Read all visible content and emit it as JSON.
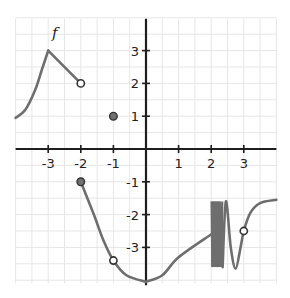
{
  "chart_data": {
    "type": "line",
    "title": "",
    "function_label": "f",
    "xlabel": "",
    "ylabel": "",
    "xlim": [
      -4,
      4
    ],
    "ylim": [
      -4,
      4
    ],
    "grid": true,
    "minor_grid_step": 0.5,
    "x_ticks": [
      -3,
      -2,
      -1,
      1,
      2,
      3
    ],
    "x_tick_labels": [
      "-3",
      "-2",
      "-1",
      "1",
      "2",
      "3"
    ],
    "y_ticks": [
      3,
      2,
      1,
      -1,
      -2,
      -3
    ],
    "y_tick_labels": [
      "3",
      "2",
      "1",
      "-1",
      "-2",
      "-3"
    ],
    "pieces": [
      {
        "name": "left-rising-curve",
        "points": [
          [
            -4,
            0.95
          ],
          [
            -3.7,
            1.2
          ],
          [
            -3.4,
            1.8
          ],
          [
            -3.2,
            2.4
          ],
          [
            -3,
            3
          ]
        ]
      },
      {
        "name": "left-falling-segment",
        "points": [
          [
            -3,
            3
          ],
          [
            -2,
            2
          ]
        ]
      },
      {
        "name": "middle-falling-curve",
        "points": [
          [
            -2,
            -1
          ],
          [
            -1.6,
            -2
          ],
          [
            -1.3,
            -2.8
          ],
          [
            -1,
            -3.4
          ],
          [
            -0.6,
            -3.85
          ],
          [
            0,
            -4.05
          ]
        ]
      },
      {
        "name": "rising-to-oscillation",
        "points": [
          [
            0,
            -4.05
          ],
          [
            0.5,
            -3.85
          ],
          [
            1,
            -3.3
          ],
          [
            2,
            -2.6
          ]
        ]
      },
      {
        "name": "oscillation-band",
        "x_range": [
          2,
          2.35
        ],
        "y_range": [
          -1.6,
          -3.6
        ]
      },
      {
        "name": "right-wave",
        "points": [
          [
            2.35,
            -3.6
          ],
          [
            2.45,
            -1.6
          ],
          [
            2.6,
            -3.0
          ],
          [
            2.75,
            -3.65
          ],
          [
            2.9,
            -3.0
          ],
          [
            3,
            -2.5
          ],
          [
            3.2,
            -1.95
          ],
          [
            3.5,
            -1.65
          ],
          [
            4,
            -1.55
          ]
        ]
      }
    ],
    "open_points": [
      [
        -2,
        2
      ],
      [
        -1,
        -3.4
      ],
      [
        3,
        -2.5
      ]
    ],
    "closed_points": [
      [
        -1,
        1
      ],
      [
        -2,
        -1
      ]
    ],
    "colors": {
      "curve": "#6e6e6e",
      "axis": "#1e1e1e",
      "grid": "#e6e6e6",
      "closed_point_fill": "#707070",
      "closed_point_stroke": "#333333",
      "open_point_fill": "#ffffff",
      "open_point_stroke": "#333333"
    }
  }
}
